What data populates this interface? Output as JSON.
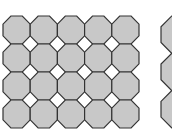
{
  "diagram": {
    "type": "truncated-square-tiling",
    "main_grid": {
      "columns": 5,
      "rows": 4,
      "x": 3,
      "y": 16,
      "cell_w": 27.2,
      "cell_h": 28
    },
    "side_column": {
      "rows": 3,
      "x": 161,
      "y": 16,
      "cell_w": 37,
      "cell_h": 37.3
    },
    "colors": {
      "octagon_fill": "#c8c8c8",
      "stroke": "#333333",
      "square_fill": "#ffffff",
      "background": "#ffffff"
    }
  }
}
